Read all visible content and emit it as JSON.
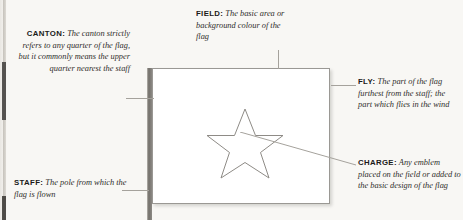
{
  "diagram": {
    "background_color": "#f8f7f4",
    "line_color": "#a5a29c",
    "ink_color": "#2f2d2b"
  },
  "flag": {
    "field_label": "flag-field",
    "staff_label": "flag-staff",
    "charge_label": "flag-charge-star",
    "charge_shape": "five-pointed-star",
    "field_color": "#ffffff",
    "staff_color": "#726f6a",
    "outline_color": "#9a9894"
  },
  "callouts": [
    {
      "key": "canton",
      "term": "CANTON:",
      "description": "The canton strictly refers to any quarter of the flag, but it commonly means the upper quarter nearest the staff"
    },
    {
      "key": "field",
      "term": "FIELD:",
      "description": "The basic area or background colour of the flag"
    },
    {
      "key": "fly",
      "term": "FLY:",
      "description": "The part of the flag furthest from the staff; the part which flies in the wind"
    },
    {
      "key": "charge",
      "term": "CHARGE:",
      "description": "Any emblem placed on the field or added to the basic design of the flag"
    },
    {
      "key": "staff",
      "term": "STAFF:",
      "description": "The pole from which the flag is flown"
    }
  ]
}
